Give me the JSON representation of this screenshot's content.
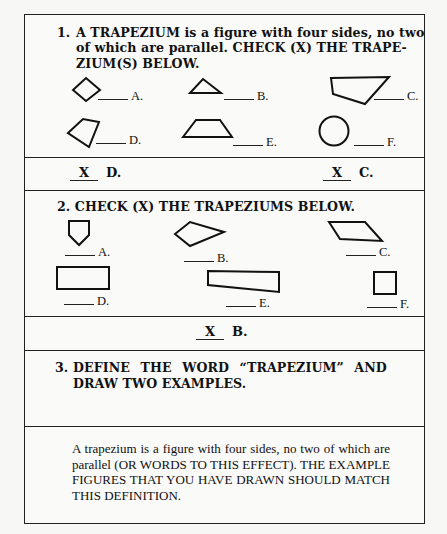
{
  "question1": {
    "number": "1.",
    "lines": [
      "A TRAPEZIUM is a figure with four sides, no two",
      "of which are parallel. CHECK (X) THE TRAPE-",
      "ZIUM(S) BELOW."
    ],
    "options": [
      {
        "letter": "A.",
        "shape": "diamond-icon"
      },
      {
        "letter": "B.",
        "shape": "triangle-icon"
      },
      {
        "letter": "C.",
        "shape": "irregular-quadrilateral-icon"
      },
      {
        "letter": "D.",
        "shape": "kite-quadrilateral-icon"
      },
      {
        "letter": "E.",
        "shape": "isosceles-trapezoid-icon"
      },
      {
        "letter": "F.",
        "shape": "circle-icon"
      }
    ]
  },
  "answer1": {
    "items": [
      {
        "mark": "X",
        "letter": "D."
      },
      {
        "mark": "X",
        "letter": "C."
      }
    ]
  },
  "question2": {
    "text": "2. CHECK (X) THE TRAPEZIUMS BELOW.",
    "options": [
      {
        "letter": "A.",
        "shape": "pentagon-icon"
      },
      {
        "letter": "B.",
        "shape": "irregular-quadrilateral-icon"
      },
      {
        "letter": "C.",
        "shape": "parallelogram-icon"
      },
      {
        "letter": "D.",
        "shape": "rectangle-icon"
      },
      {
        "letter": "E.",
        "shape": "trapezoid-icon"
      },
      {
        "letter": "F.",
        "shape": "square-icon"
      }
    ]
  },
  "answer2": {
    "items": [
      {
        "mark": "X",
        "letter": "B."
      }
    ]
  },
  "question3": {
    "number": "3.",
    "lines": [
      "DEFINE THE WORD “TRAPEZIUM” AND",
      "DRAW TWO EXAMPLES."
    ]
  },
  "answer3": {
    "text": "A trapezium is a figure with four sides, no two of which are parallel (OR WORDS TO THIS EFFECT). THE EXAMPLE FIGURES THAT YOU HAVE DRAWN SHOULD MATCH THIS DEFINITION."
  }
}
